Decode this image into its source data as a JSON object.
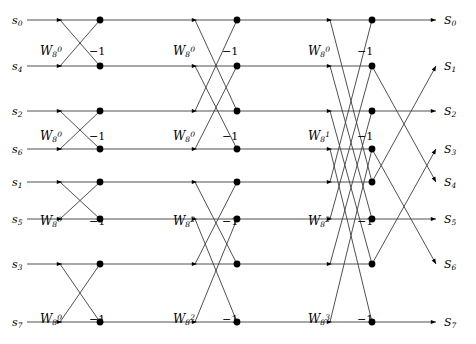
{
  "figure": {
    "width": 476,
    "height": 344,
    "background": "#ffffff",
    "line_color": "#3c3c3c",
    "node_color": "#000000"
  },
  "chart_data": {
    "type": "diagram",
    "subtype": "fft-butterfly-signal-flow-graph",
    "n_points": 8,
    "n_stages": 3,
    "inputs": [
      {
        "id": "in0",
        "label": "s",
        "sub": "0",
        "row": 0
      },
      {
        "id": "in1",
        "label": "s",
        "sub": "4",
        "row": 1
      },
      {
        "id": "in2",
        "label": "s",
        "sub": "2",
        "row": 2
      },
      {
        "id": "in3",
        "label": "s",
        "sub": "6",
        "row": 3
      },
      {
        "id": "in4",
        "label": "s",
        "sub": "1",
        "row": 4
      },
      {
        "id": "in5",
        "label": "s",
        "sub": "5",
        "row": 5
      },
      {
        "id": "in6",
        "label": "s",
        "sub": "3",
        "row": 6
      },
      {
        "id": "in7",
        "label": "s",
        "sub": "7",
        "row": 7
      }
    ],
    "outputs": [
      {
        "id": "out0",
        "label": "S",
        "sub": "0",
        "from_row": 0,
        "y": 20
      },
      {
        "id": "out1",
        "label": "S",
        "sub": "1",
        "from_row": 4,
        "y": 66
      },
      {
        "id": "out2",
        "label": "S",
        "sub": "2",
        "from_row": 2,
        "y": 111
      },
      {
        "id": "out3",
        "label": "S",
        "sub": "3",
        "from_row": 6,
        "y": 149
      },
      {
        "id": "out4",
        "label": "S",
        "sub": "4",
        "from_row": 1,
        "y": 182
      },
      {
        "id": "out5",
        "label": "S",
        "sub": "5",
        "from_row": 5,
        "y": 219
      },
      {
        "id": "out6",
        "label": "S",
        "sub": "6",
        "from_row": 3,
        "y": 264
      },
      {
        "id": "out7",
        "label": "S",
        "sub": "7",
        "from_row": 7,
        "y": 322
      }
    ],
    "twiddle_labels": [
      {
        "stage": 1,
        "row_pair": 0,
        "base": "W",
        "sub": "8",
        "sup": "0",
        "minus": "−1",
        "x": 40,
        "y": 55
      },
      {
        "stage": 1,
        "row_pair": 1,
        "base": "W",
        "sub": "8",
        "sup": "0",
        "minus": "−1",
        "x": 40,
        "y": 140
      },
      {
        "stage": 1,
        "row_pair": 2,
        "base": "W",
        "sub": "8",
        "sup": "0",
        "minus": "−1",
        "x": 40,
        "y": 225
      },
      {
        "stage": 1,
        "row_pair": 3,
        "base": "W",
        "sub": "8",
        "sup": "0",
        "minus": "−1",
        "x": 40,
        "y": 323
      },
      {
        "stage": 2,
        "row_pair": 0,
        "base": "W",
        "sub": "8",
        "sup": "0",
        "minus": "−1",
        "x": 173,
        "y": 55
      },
      {
        "stage": 2,
        "row_pair": 1,
        "base": "W",
        "sub": "8",
        "sup": "0",
        "minus": "−1",
        "x": 173,
        "y": 140
      },
      {
        "stage": 2,
        "row_pair": 2,
        "base": "W",
        "sub": "8",
        "sup": "2",
        "minus": "−1",
        "x": 173,
        "y": 225
      },
      {
        "stage": 2,
        "row_pair": 3,
        "base": "W",
        "sub": "8",
        "sup": "2",
        "minus": "−1",
        "x": 173,
        "y": 323
      },
      {
        "stage": 3,
        "row_pair": 0,
        "base": "W",
        "sub": "8",
        "sup": "0",
        "minus": "−1",
        "x": 308,
        "y": 55
      },
      {
        "stage": 3,
        "row_pair": 1,
        "base": "W",
        "sub": "8",
        "sup": "1",
        "minus": "−1",
        "x": 308,
        "y": 140
      },
      {
        "stage": 3,
        "row_pair": 2,
        "base": "W",
        "sub": "8",
        "sup": "2",
        "minus": "−1",
        "x": 308,
        "y": 225
      },
      {
        "stage": 3,
        "row_pair": 3,
        "base": "W",
        "sub": "8",
        "sup": "3",
        "minus": "−1",
        "x": 308,
        "y": 323
      }
    ],
    "minus_one_label": "−1",
    "row_y": [
      20,
      66,
      111,
      149,
      182,
      219,
      264,
      322
    ],
    "stage_columns": [
      {
        "stage": 1,
        "in_x": 30,
        "mul_x": 60,
        "node_x": 100
      },
      {
        "stage": 2,
        "in_x": 130,
        "mul_x": 195,
        "node_x": 237
      },
      {
        "stage": 3,
        "in_x": 265,
        "mul_x": 330,
        "node_x": 372
      }
    ],
    "butterfly_pairs_stage1": [
      [
        0,
        1
      ],
      [
        2,
        3
      ],
      [
        4,
        5
      ],
      [
        6,
        7
      ]
    ],
    "butterfly_pairs_stage2": [
      [
        0,
        2
      ],
      [
        1,
        3
      ],
      [
        4,
        6
      ],
      [
        5,
        7
      ]
    ],
    "butterfly_pairs_stage3": [
      [
        0,
        4
      ],
      [
        1,
        5
      ],
      [
        2,
        6
      ],
      [
        3,
        7
      ]
    ]
  }
}
